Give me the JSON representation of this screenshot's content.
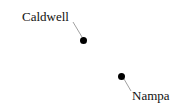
{
  "map": {
    "background": "#ffffff",
    "places": [
      {
        "name": "Caldwell",
        "type": "city",
        "dot": [
          83,
          40
        ],
        "label_pos": [
          22,
          9
        ]
      },
      {
        "name": "Nampa",
        "type": "city",
        "dot": [
          122,
          76
        ],
        "label_pos": [
          132,
          88
        ]
      }
    ]
  }
}
